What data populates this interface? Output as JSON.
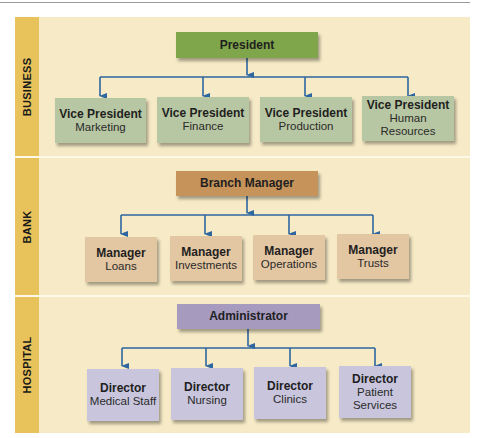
{
  "colors": {
    "panel_background": "#f6ebc6",
    "label_stripe": "#e8c25a",
    "connector": "#2e66a0",
    "business_head": "#7fa64a",
    "business_child": "#b8c7a3",
    "bank_head": "#c6935a",
    "bank_child": "#e3c6a2",
    "hospital_head": "#a79abf",
    "hospital_child": "#c8c5dc"
  },
  "sections": [
    {
      "label": "BUSINESS",
      "head": "President",
      "children": [
        {
          "title": "Vice President",
          "sub": "Marketing"
        },
        {
          "title": "Vice President",
          "sub": "Finance"
        },
        {
          "title": "Vice President",
          "sub": "Production"
        },
        {
          "title": "Vice President",
          "sub": "Human Resources"
        }
      ]
    },
    {
      "label": "BANK",
      "head": "Branch Manager",
      "children": [
        {
          "title": "Manager",
          "sub": "Loans"
        },
        {
          "title": "Manager",
          "sub": "Investments"
        },
        {
          "title": "Manager",
          "sub": "Operations"
        },
        {
          "title": "Manager",
          "sub": "Trusts"
        }
      ]
    },
    {
      "label": "HOSPITAL",
      "head": "Administrator",
      "children": [
        {
          "title": "Director",
          "sub": "Medical Staff"
        },
        {
          "title": "Director",
          "sub": "Nursing"
        },
        {
          "title": "Director",
          "sub": "Clinics"
        },
        {
          "title": "Director",
          "sub": "Patient\nServices"
        }
      ]
    }
  ]
}
